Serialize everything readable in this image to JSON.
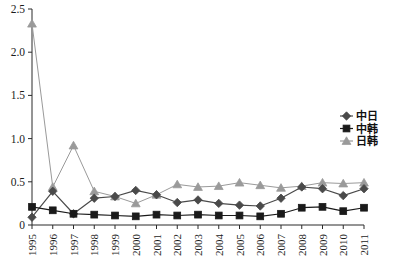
{
  "chart_data": {
    "type": "line",
    "title": "",
    "subtitle": "",
    "xlabel": "",
    "ylabel": "",
    "categories": [
      "1995",
      "1996",
      "1997",
      "1998",
      "1999",
      "2000",
      "2001",
      "2002",
      "2003",
      "2004",
      "2005",
      "2006",
      "2007",
      "2008",
      "2009",
      "2010",
      "2011"
    ],
    "x": [
      1995,
      1996,
      1997,
      1998,
      1999,
      2000,
      2001,
      2002,
      2003,
      2004,
      2005,
      2006,
      2007,
      2008,
      2009,
      2010,
      2011
    ],
    "ylim": [
      0,
      2.5
    ],
    "yticks": [
      0,
      0.5,
      1.0,
      1.5,
      2.0,
      2.5
    ],
    "ytick_labels": [
      "0",
      "0.5",
      "1.0",
      "1.5",
      "2.0",
      "2.5"
    ],
    "grid": false,
    "legend_position": "right",
    "series": [
      {
        "name": "中日",
        "marker": "diamond",
        "color": "#4a4a4a",
        "values": [
          0.09,
          0.39,
          0.13,
          0.31,
          0.33,
          0.4,
          0.35,
          0.26,
          0.29,
          0.25,
          0.23,
          0.22,
          0.31,
          0.44,
          0.42,
          0.34,
          0.42
        ]
      },
      {
        "name": "中韩",
        "marker": "square",
        "color": "#1a1a1a",
        "values": [
          0.21,
          0.17,
          0.13,
          0.12,
          0.11,
          0.1,
          0.12,
          0.11,
          0.12,
          0.11,
          0.11,
          0.1,
          0.13,
          0.2,
          0.21,
          0.16,
          0.2
        ]
      },
      {
        "name": "日韩",
        "marker": "triangle",
        "color": "#9a9a9a",
        "values": [
          2.33,
          0.44,
          0.92,
          0.39,
          0.33,
          0.25,
          0.35,
          0.47,
          0.44,
          0.45,
          0.49,
          0.46,
          0.43,
          0.45,
          0.49,
          0.48,
          0.49
        ]
      }
    ]
  },
  "legend": {
    "entries": [
      {
        "label": "中日",
        "marker": "diamond-marker-icon"
      },
      {
        "label": "中韩",
        "marker": "square-marker-icon"
      },
      {
        "label": "日韩",
        "marker": "triangle-marker-icon"
      }
    ]
  },
  "colors": {
    "series_china_japan": "#4a4a4a",
    "series_china_korea": "#1a1a1a",
    "series_japan_korea": "#9a9a9a",
    "axis": "#2a2a2a",
    "background": "#ffffff"
  },
  "caption": {
    "text": ""
  }
}
